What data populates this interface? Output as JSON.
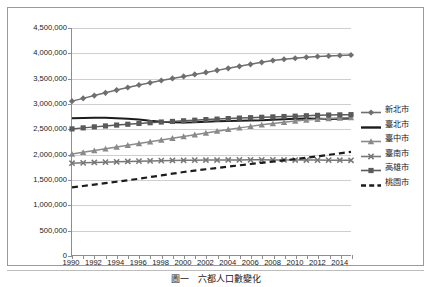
{
  "chart_data": {
    "type": "line",
    "title": "",
    "xlabel": "",
    "ylabel": "",
    "xlim": [
      1990,
      2015
    ],
    "ylim": [
      0,
      4500000
    ],
    "grid": true,
    "legend_position": "right",
    "y_ticks": [
      "0",
      "500,000",
      "1,000,000",
      "1,500,000",
      "2,000,000",
      "2,500,000",
      "3,000,000",
      "3,500,000",
      "4,000,000",
      "4,500,000"
    ],
    "y_tick_values": [
      0,
      500000,
      1000000,
      1500000,
      2000000,
      2500000,
      3000000,
      3500000,
      4000000,
      4500000
    ],
    "x_tick_labels": [
      "1990",
      "1992",
      "1994",
      "1996",
      "1998",
      "2000",
      "2002",
      "2004",
      "2006",
      "2008",
      "2010",
      "2012",
      "2014"
    ],
    "x_tick_values": [
      1990,
      1992,
      1994,
      1996,
      1998,
      2000,
      2002,
      2004,
      2006,
      2008,
      2010,
      2012,
      2014
    ],
    "x": [
      1990,
      1991,
      1992,
      1993,
      1994,
      1995,
      1996,
      1997,
      1998,
      1999,
      2000,
      2001,
      2002,
      2003,
      2004,
      2005,
      2006,
      2007,
      2008,
      2009,
      2010,
      2011,
      2012,
      2013,
      2014,
      2015
    ],
    "series": [
      {
        "name": "新北市",
        "marker": "diamond",
        "line_style": "solid",
        "color": "#6f6f6f",
        "values": [
          3050000,
          3105000,
          3160000,
          3215000,
          3270000,
          3320000,
          3370000,
          3415000,
          3460000,
          3500000,
          3540000,
          3580000,
          3620000,
          3660000,
          3700000,
          3740000,
          3780000,
          3820000,
          3855000,
          3880000,
          3900000,
          3920000,
          3935000,
          3945000,
          3955000,
          3965000
        ]
      },
      {
        "name": "臺北市",
        "marker": "none",
        "line_style": "solid",
        "color": "#1c1c1c",
        "values": [
          2710000,
          2718000,
          2722000,
          2720000,
          2712000,
          2700000,
          2685000,
          2660000,
          2640000,
          2630000,
          2625000,
          2630000,
          2640000,
          2650000,
          2655000,
          2660000,
          2665000,
          2670000,
          2680000,
          2690000,
          2700000,
          2705000,
          2700000,
          2695000,
          2700000,
          2705000
        ]
      },
      {
        "name": "臺中市",
        "marker": "triangle",
        "line_style": "solid",
        "color": "#8a8a8a",
        "values": [
          2000000,
          2035000,
          2070000,
          2105000,
          2140000,
          2175000,
          2210000,
          2245000,
          2280000,
          2315000,
          2350000,
          2385000,
          2420000,
          2455000,
          2490000,
          2520000,
          2550000,
          2580000,
          2605000,
          2630000,
          2655000,
          2675000,
          2690000,
          2705000,
          2715000,
          2725000
        ]
      },
      {
        "name": "臺南市",
        "marker": "cross",
        "line_style": "solid",
        "color": "#777777",
        "values": [
          1820000,
          1827000,
          1834000,
          1841000,
          1848000,
          1854000,
          1860000,
          1865000,
          1870000,
          1874000,
          1878000,
          1880000,
          1882000,
          1883000,
          1884000,
          1885000,
          1886000,
          1886000,
          1885000,
          1884000,
          1883000,
          1882000,
          1881000,
          1880000,
          1879000,
          1878000
        ]
      },
      {
        "name": "高雄市",
        "marker": "square",
        "line_style": "solid",
        "color": "#5a5a5a",
        "values": [
          2500000,
          2520000,
          2540000,
          2558000,
          2576000,
          2592000,
          2608000,
          2622000,
          2636000,
          2648000,
          2660000,
          2672000,
          2684000,
          2694000,
          2704000,
          2714000,
          2722000,
          2730000,
          2738000,
          2745000,
          2752000,
          2760000,
          2768000,
          2774000,
          2778000,
          2782000
        ]
      },
      {
        "name": "桃園市",
        "marker": "none",
        "line_style": "dashed",
        "color": "#1c1c1c",
        "values": [
          1340000,
          1368000,
          1396000,
          1424000,
          1452000,
          1482000,
          1512000,
          1545000,
          1578000,
          1612000,
          1645000,
          1672000,
          1700000,
          1726000,
          1752000,
          1778000,
          1804000,
          1828000,
          1852000,
          1876000,
          1900000,
          1928000,
          1956000,
          1986000,
          2016000,
          2046000
        ]
      }
    ]
  },
  "legend": {
    "items": [
      {
        "label": "新北市",
        "key": "diamond-line-key"
      },
      {
        "label": "臺北市",
        "key": "plain-line-key"
      },
      {
        "label": "臺中市",
        "key": "triangle-line-key"
      },
      {
        "label": "臺南市",
        "key": "cross-line-key"
      },
      {
        "label": "高雄市",
        "key": "square-line-key"
      },
      {
        "label": "桃園市",
        "key": "dashed-line-key"
      }
    ]
  },
  "caption": {
    "text": "圖一　六都人口數變化"
  }
}
